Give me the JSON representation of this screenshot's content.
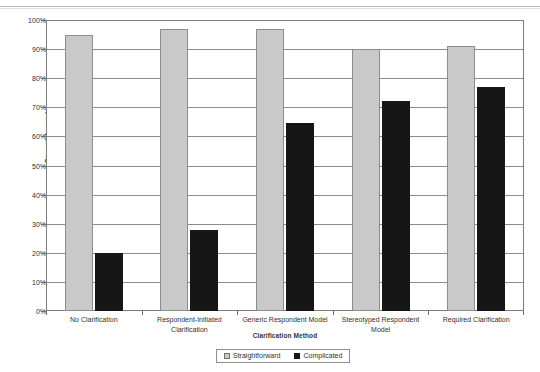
{
  "chart_data": {
    "type": "bar",
    "title": "",
    "xlabel": "Clarification Method",
    "ylabel": "Percent Accurate",
    "ylim": [
      0,
      100
    ],
    "ytick_labels": [
      "100%",
      "90%",
      "80%",
      "70%",
      "60%",
      "50%",
      "40%",
      "30%",
      "20%",
      "10%",
      "0%"
    ],
    "ytick_values": [
      100,
      90,
      80,
      70,
      60,
      50,
      40,
      30,
      20,
      10,
      0
    ],
    "grid": true,
    "legend_position": "bottom",
    "categories": [
      "No Clarification",
      "Respondent-Initiated Clarification",
      "Generic Respondent Model",
      "Stereotyped Respondent Model",
      "Required Clarification"
    ],
    "series": [
      {
        "name": "Straightforward",
        "color": "#c9c9c9",
        "values": [
          95,
          97,
          97,
          90,
          91
        ]
      },
      {
        "name": "Complicated",
        "color": "#161616",
        "values": [
          20,
          28,
          64.5,
          72,
          77
        ]
      }
    ]
  }
}
